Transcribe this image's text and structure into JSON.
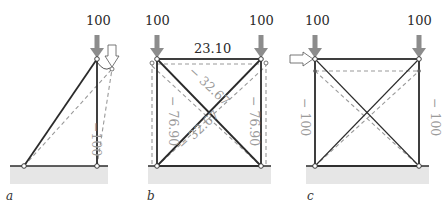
{
  "panels": [
    {
      "caption": "a",
      "load_label": "100",
      "member_forces": [
        {
          "member": "vertical",
          "value": "−100"
        }
      ],
      "notes": "Triangle truss; horizontal hollow arrow indicates displaced top node"
    },
    {
      "caption": "b",
      "load_labels": [
        "100",
        "100"
      ],
      "member_forces": [
        {
          "member": "top",
          "value": "23.10"
        },
        {
          "member": "left",
          "value": "− 76.90"
        },
        {
          "member": "right",
          "value": "− 76.90"
        },
        {
          "member": "diag-upper",
          "value": "− 32.67"
        },
        {
          "member": "diag-lower",
          "value": "− 32.67"
        }
      ]
    },
    {
      "caption": "c",
      "load_labels": [
        "100",
        "100"
      ],
      "member_forces": [
        {
          "member": "left",
          "value": "− 100"
        },
        {
          "member": "right",
          "value": "− 100"
        }
      ]
    }
  ],
  "colors": {
    "member": "#2b2b2b",
    "dashed": "#9a9a9a",
    "load_arrow": "#8c8c8c",
    "ground": "#e6e6e6",
    "force_text": "#9a9a9a"
  }
}
